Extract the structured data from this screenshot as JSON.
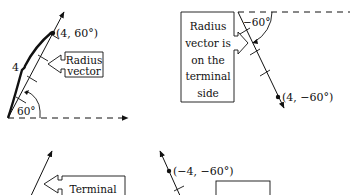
{
  "panels": [
    {
      "id": "top-left",
      "point_label": "(4, 60°)",
      "radius_label": "4",
      "angle_label": "60°",
      "callout_lines": [
        "Radius",
        "vector"
      ]
    },
    {
      "id": "top-right",
      "point_label": "(4, −60°)",
      "angle_label": "−60°",
      "callout_lines": [
        "Radius",
        "vector is",
        "on the",
        "terminal",
        "side"
      ]
    },
    {
      "id": "bottom-left",
      "callout_lines": [
        "Terminal"
      ]
    },
    {
      "id": "bottom-right",
      "point_label": "(−4, −60°)"
    }
  ],
  "colors": {
    "ink": "#111111",
    "background": "#ffffff"
  }
}
